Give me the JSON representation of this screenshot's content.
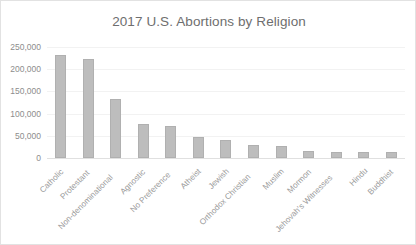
{
  "chart": {
    "title": "2017 U.S. Abortions by Religion",
    "bar_color": "#bdbdbd",
    "title_color": "#6e6e6e",
    "axis_text_color": "#8d8d8d",
    "grid_color": "#f2f2f2",
    "border_color": "#e2e2e2"
  },
  "chart_data": {
    "type": "bar",
    "title": "2017 U.S. Abortions by Religion",
    "xlabel": "",
    "ylabel": "",
    "ylim": [
      0,
      250000
    ],
    "yticks": [
      0,
      50000,
      100000,
      150000,
      200000,
      250000
    ],
    "ytick_labels": [
      "0",
      "50,000",
      "100,000",
      "150,000",
      "200,000",
      "250,000"
    ],
    "grid": true,
    "legend": false,
    "categories": [
      "Catholic",
      "Protestant",
      "Non-denominational",
      "Agnostic",
      "No Preference",
      "Atheist",
      "Jewish",
      "Orthodox Christian",
      "Muslim",
      "Mormon",
      "Jehovah's Witnesses",
      "Hindu",
      "Buddhist"
    ],
    "values": [
      233000,
      224000,
      133000,
      77000,
      71000,
      48000,
      41000,
      29000,
      28000,
      16000,
      14000,
      13000,
      13000
    ]
  }
}
